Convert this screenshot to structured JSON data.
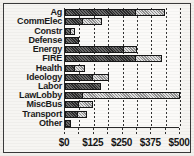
{
  "chart_data": {
    "type": "bar",
    "orientation": "horizontal",
    "stacked": true,
    "title": "",
    "subtitle": "",
    "xlabel": "",
    "ylabel": "",
    "xlim": [
      0,
      500
    ],
    "ylim": null,
    "grid": true,
    "legend": null,
    "legend_position": "none",
    "currency_prefix": "$",
    "xticks": [
      {
        "value": 0,
        "label": "$0"
      },
      {
        "value": 62.5,
        "label": ""
      },
      {
        "value": 125,
        "label": "$125"
      },
      {
        "value": 187.5,
        "label": ""
      },
      {
        "value": 250,
        "label": "$250"
      },
      {
        "value": 312.5,
        "label": ""
      },
      {
        "value": 375,
        "label": "$375"
      },
      {
        "value": 437.5,
        "label": ""
      },
      {
        "value": 500,
        "label": "$500"
      }
    ],
    "categories": [
      "Ag",
      "CommElec",
      "Constr",
      "Defense",
      "Energy",
      "FIRE",
      "Health",
      "Ideology",
      "Labor",
      "LawLobby",
      "MiscBus",
      "Transport",
      "Other"
    ],
    "series": [
      {
        "name": "dark-segment",
        "color": "#2b2b2b",
        "values": [
          310,
          80,
          26,
          62,
          258,
          310,
          44,
          123,
          158,
          79,
          62,
          57,
          26
        ]
      },
      {
        "name": "light-segment",
        "color": "#bdbdbd",
        "values": [
          125,
          79,
          18,
          0,
          53,
          110,
          44,
          70,
          0,
          421,
          61,
          40,
          0
        ]
      }
    ],
    "totals": [
      435,
      159,
      44,
      62,
      311,
      420,
      88,
      193,
      158,
      500,
      123,
      97,
      26
    ],
    "bars": [
      {
        "category": "Ag",
        "dark": 310,
        "light": 125,
        "total": 435
      },
      {
        "category": "CommElec",
        "dark": 80,
        "light": 79,
        "total": 159
      },
      {
        "category": "Constr",
        "dark": 26,
        "light": 18,
        "total": 44
      },
      {
        "category": "Defense",
        "dark": 62,
        "light": 0,
        "total": 62
      },
      {
        "category": "Energy",
        "dark": 258,
        "light": 53,
        "total": 311
      },
      {
        "category": "FIRE",
        "dark": 310,
        "light": 110,
        "total": 420
      },
      {
        "category": "Health",
        "dark": 44,
        "light": 44,
        "total": 88
      },
      {
        "category": "Ideology",
        "dark": 123,
        "light": 70,
        "total": 193
      },
      {
        "category": "Labor",
        "dark": 158,
        "light": 0,
        "total": 158
      },
      {
        "category": "LawLobby",
        "dark": 79,
        "light": 421,
        "total": 500
      },
      {
        "category": "MiscBus",
        "dark": 62,
        "light": 61,
        "total": 123
      },
      {
        "category": "Transport",
        "dark": 57,
        "light": 40,
        "total": 97
      },
      {
        "category": "Other",
        "dark": 26,
        "light": 0,
        "total": 26
      }
    ]
  }
}
